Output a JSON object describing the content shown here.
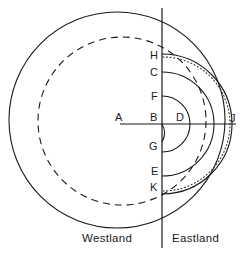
{
  "figure": {
    "stroke_color": "#1a1a1a",
    "background_color": "#ffffff",
    "point_labels": [
      {
        "id": "A",
        "text": "A",
        "x": 118,
        "y": 118
      },
      {
        "id": "H",
        "text": "H",
        "x": 151,
        "y": 56
      },
      {
        "id": "C",
        "text": "C",
        "x": 151,
        "y": 73
      },
      {
        "id": "F",
        "text": "F",
        "x": 152,
        "y": 97
      },
      {
        "id": "B",
        "text": "B",
        "x": 151,
        "y": 118
      },
      {
        "id": "D",
        "text": "D",
        "x": 179,
        "y": 118
      },
      {
        "id": "J",
        "text": "J",
        "x": 232,
        "y": 119
      },
      {
        "id": "G",
        "text": "G",
        "x": 150,
        "y": 147
      },
      {
        "id": "E",
        "text": "E",
        "x": 152,
        "y": 172
      },
      {
        "id": "K",
        "text": "K",
        "x": 151,
        "y": 188
      }
    ],
    "region_labels": [
      {
        "id": "westland",
        "text": "Westland",
        "x": 82,
        "y": 238
      },
      {
        "id": "eastland",
        "text": "Eastland",
        "x": 172,
        "y": 238
      }
    ],
    "axes": {
      "meridian_line": {
        "x": 162,
        "y1": 8,
        "y2": 248
      },
      "equator_line": {
        "y": 124,
        "x1": 120,
        "x2": 236
      }
    },
    "curves": [
      {
        "id": "outer-solid-circle",
        "style": "solid",
        "cx": 117,
        "cy": 120,
        "r": 108
      },
      {
        "id": "dashed-circle",
        "style": "dashed",
        "cx": 122,
        "cy": 121,
        "r": 84
      },
      {
        "id": "dotted-arc",
        "style": "dotted",
        "cx": 162,
        "cy": 124,
        "r": 68
      },
      {
        "id": "arc-H-J",
        "style": "solid",
        "cx": 162,
        "cy": 124,
        "r": 70
      },
      {
        "id": "arc-C-K",
        "style": "solid",
        "cx": 162,
        "cy": 124,
        "r": 52
      },
      {
        "id": "arc-F-E",
        "style": "solid",
        "cx": 162,
        "cy": 124,
        "r": 28
      },
      {
        "id": "arc-B-G",
        "style": "solid",
        "cx": 162,
        "cy": 124,
        "r": 18
      }
    ]
  }
}
